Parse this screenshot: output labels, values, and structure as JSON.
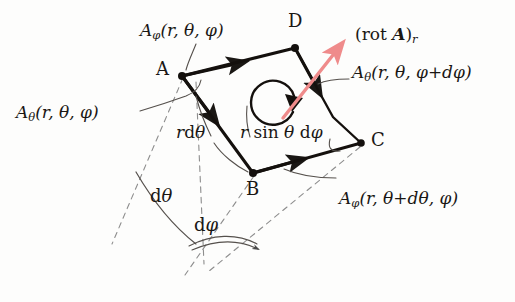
{
  "figure": {
    "background_color": "#fdfdfc",
    "ink_color": "#1a1714",
    "accent_color": "#ef8b8b",
    "dashed_color": "#8a8a8a"
  },
  "vertices": [
    {
      "name": "A",
      "label": "A",
      "x": 182,
      "y": 76
    },
    {
      "name": "B",
      "label": "B",
      "x": 253,
      "y": 173
    },
    {
      "name": "C",
      "label": "C",
      "x": 361,
      "y": 143
    },
    {
      "name": "D",
      "label": "D",
      "x": 295,
      "y": 48
    }
  ],
  "vertex_label_positions": [
    {
      "label": "A",
      "x": 156,
      "y": 64
    },
    {
      "label": "B",
      "x": 247,
      "y": 180
    },
    {
      "label": "C",
      "x": 370,
      "y": 130
    },
    {
      "label": "D",
      "x": 289,
      "y": 16
    }
  ],
  "labels": {
    "a_phi_top": "Aφ(r, θ, φ)",
    "a_theta_left": "Aθ(r, θ, φ)",
    "a_theta_right": "Aθ(r, θ, φ+dφ)",
    "a_phi_bottom": "Aφ(r, θ+dθ, φ)",
    "rot_a_r": "(rot A)r",
    "r_dtheta": "rdθ",
    "r_sin_theta_dphi": "r sin θ dφ",
    "d_theta": "dθ",
    "d_phi": "dφ"
  },
  "label_parts": {
    "a_phi_top": {
      "sym": "A",
      "sub": "φ",
      "args": "(r, θ, φ)"
    },
    "a_theta_left": {
      "sym": "A",
      "sub": "θ",
      "args": "(r, θ, φ)"
    },
    "a_theta_right": {
      "sym": "A",
      "sub": "θ",
      "args": "(r, θ, φ+dφ)"
    },
    "a_phi_bottom": {
      "sym": "A",
      "sub": "φ",
      "args": "(r, θ+dθ, φ)"
    },
    "rot_a_r": {
      "open": "(rot ",
      "vec": "A",
      "close": ")",
      "sub": "r"
    },
    "r_dtheta": {
      "r": "r",
      "d": "d",
      "theta": "θ"
    },
    "r_sin": {
      "r": "r",
      "sin": "sin",
      "theta": "θ",
      "d": "d",
      "phi": "φ"
    },
    "d_theta": {
      "d": "d",
      "sym": "θ"
    },
    "d_phi": {
      "d": "d",
      "sym": "φ"
    }
  },
  "edges": [
    {
      "name": "A-to-D",
      "from": "A",
      "to": "D",
      "arrow": "mid",
      "field": "A_phi(r,theta,phi)"
    },
    {
      "name": "A-to-B",
      "from": "A",
      "to": "B",
      "arrow": "mid",
      "field": "A_theta(r,theta,phi)"
    },
    {
      "name": "B-to-C",
      "from": "B",
      "to": "C",
      "arrow": "mid",
      "field": "A_phi(r,theta+dtheta,phi)"
    },
    {
      "name": "D-to-C",
      "from": "D",
      "to": "C",
      "arrow": "mid",
      "field": "A_theta(r,theta,phi+dphi)"
    }
  ],
  "circulation_arrow": {
    "name": "counterclockwise-circulation",
    "center_x": 276,
    "center_y": 104,
    "radius": 22,
    "direction": "counterclockwise"
  },
  "rot_vector": {
    "name": "rot-A-radial-vector",
    "from_x": 283,
    "from_y": 118,
    "to_x": 341,
    "to_y": 46,
    "color": "#ef8b8b"
  },
  "angles": [
    {
      "name": "d-theta-angle",
      "label": "dθ"
    },
    {
      "name": "d-phi-angle",
      "label": "dφ"
    }
  ]
}
